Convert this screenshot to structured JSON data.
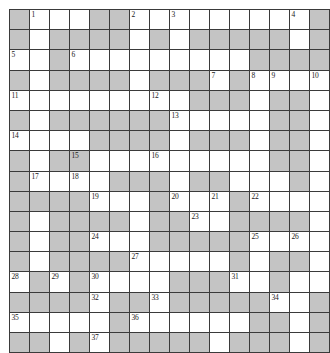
{
  "puzzle": {
    "type": "crossword-grid",
    "rows": 17,
    "columns": 16,
    "cell_size_px": 19,
    "colors": {
      "block_fill": "#c4c4c4",
      "open_fill": "#ffffff",
      "grid_line": "#3a3a3a",
      "number_text": "#1a1a1a",
      "page_background": "#ffffff"
    },
    "clue_number_count": 41,
    "legend": {
      "0": "open (white) cell",
      "1": "blocked (shaded) cell"
    },
    "grid": [
      [
        1,
        0,
        0,
        0,
        1,
        1,
        0,
        0,
        0,
        0,
        0,
        0,
        0,
        0,
        0,
        1
      ],
      [
        1,
        0,
        1,
        1,
        1,
        1,
        0,
        1,
        0,
        1,
        1,
        1,
        1,
        1,
        0,
        1
      ],
      [
        0,
        0,
        1,
        0,
        0,
        0,
        0,
        0,
        0,
        0,
        0,
        0,
        1,
        1,
        1,
        1
      ],
      [
        1,
        0,
        1,
        1,
        1,
        1,
        0,
        1,
        1,
        1,
        0,
        1,
        0,
        0,
        0,
        0
      ],
      [
        0,
        0,
        0,
        0,
        0,
        0,
        0,
        0,
        0,
        1,
        1,
        1,
        0,
        1,
        1,
        0
      ],
      [
        1,
        0,
        1,
        1,
        1,
        1,
        1,
        1,
        0,
        0,
        0,
        0,
        0,
        1,
        1,
        0
      ],
      [
        0,
        0,
        0,
        0,
        1,
        1,
        1,
        1,
        0,
        1,
        1,
        1,
        0,
        1,
        1,
        0
      ],
      [
        1,
        0,
        1,
        1,
        0,
        0,
        0,
        0,
        0,
        0,
        0,
        0,
        0,
        1,
        1,
        0
      ],
      [
        1,
        0,
        0,
        0,
        0,
        1,
        1,
        1,
        0,
        1,
        1,
        0,
        0,
        0,
        1,
        0
      ],
      [
        1,
        1,
        1,
        1,
        0,
        0,
        0,
        1,
        0,
        0,
        0,
        1,
        0,
        0,
        0,
        0
      ],
      [
        1,
        0,
        1,
        1,
        1,
        1,
        0,
        1,
        1,
        0,
        0,
        1,
        1,
        1,
        1,
        0
      ],
      [
        1,
        0,
        1,
        1,
        0,
        0,
        0,
        1,
        1,
        1,
        1,
        1,
        0,
        0,
        0,
        0
      ],
      [
        1,
        0,
        1,
        1,
        1,
        1,
        0,
        0,
        0,
        0,
        0,
        1,
        0,
        1,
        1,
        0
      ],
      [
        0,
        1,
        0,
        1,
        0,
        0,
        0,
        0,
        1,
        1,
        1,
        0,
        0,
        1,
        0,
        0
      ],
      [
        1,
        1,
        1,
        1,
        0,
        1,
        1,
        0,
        1,
        1,
        1,
        1,
        1,
        0,
        0,
        1
      ],
      [
        0,
        0,
        0,
        0,
        0,
        1,
        0,
        0,
        0,
        0,
        0,
        0,
        1,
        1,
        0,
        1
      ],
      [
        1,
        1,
        0,
        1,
        0,
        1,
        1,
        1,
        1,
        1,
        0,
        1,
        1,
        1,
        0,
        1
      ]
    ],
    "numbers": [
      {
        "n": 1,
        "row": 1,
        "col": 2
      },
      {
        "n": 2,
        "row": 1,
        "col": 7
      },
      {
        "n": 3,
        "row": 1,
        "col": 9
      },
      {
        "n": 4,
        "row": 1,
        "col": 15
      },
      {
        "n": 5,
        "row": 3,
        "col": 1
      },
      {
        "n": 6,
        "row": 3,
        "col": 4
      },
      {
        "n": 7,
        "row": 4,
        "col": 11
      },
      {
        "n": 8,
        "row": 4,
        "col": 13
      },
      {
        "n": 9,
        "row": 4,
        "col": 14
      },
      {
        "n": 10,
        "row": 4,
        "col": 16
      },
      {
        "n": 11,
        "row": 5,
        "col": 1
      },
      {
        "n": 12,
        "row": 5,
        "col": 8
      },
      {
        "n": 13,
        "row": 6,
        "col": 9
      },
      {
        "n": 14,
        "row": 7,
        "col": 1
      },
      {
        "n": 15,
        "row": 8,
        "col": 4
      },
      {
        "n": 16,
        "row": 8,
        "col": 8
      },
      {
        "n": 17,
        "row": 9,
        "col": 2
      },
      {
        "n": 18,
        "row": 9,
        "col": 4
      },
      {
        "n": 19,
        "row": 10,
        "col": 5
      },
      {
        "n": 20,
        "row": 10,
        "col": 9
      },
      {
        "n": 21,
        "row": 10,
        "col": 11
      },
      {
        "n": 22,
        "row": 10,
        "col": 13
      },
      {
        "n": 23,
        "row": 11,
        "col": 10
      },
      {
        "n": 24,
        "row": 12,
        "col": 5
      },
      {
        "n": 25,
        "row": 12,
        "col": 13
      },
      {
        "n": 26,
        "row": 12,
        "col": 15
      },
      {
        "n": 27,
        "row": 13,
        "col": 7
      },
      {
        "n": 28,
        "row": 14,
        "col": 1
      },
      {
        "n": 29,
        "row": 14,
        "col": 3
      },
      {
        "n": 30,
        "row": 14,
        "col": 5
      },
      {
        "n": 31,
        "row": 14,
        "col": 12
      },
      {
        "n": 32,
        "row": 15,
        "col": 5
      },
      {
        "n": 33,
        "row": 15,
        "col": 8
      },
      {
        "n": 34,
        "row": 15,
        "col": 14
      },
      {
        "n": 35,
        "row": 16,
        "col": 1
      },
      {
        "n": 36,
        "row": 16,
        "col": 7
      },
      {
        "n": 37,
        "row": 17,
        "col": 5
      },
      {
        "n": 38,
        "row": 18,
        "col": 3
      },
      {
        "n": 39,
        "row": 18,
        "col": 13
      },
      {
        "n": 40,
        "row": 19,
        "col": 10
      },
      {
        "n": 41,
        "row": 20,
        "col": 10
      }
    ]
  }
}
